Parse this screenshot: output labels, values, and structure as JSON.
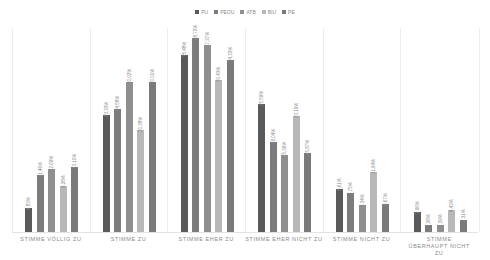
{
  "chart_data": {
    "type": "bar",
    "title": "",
    "xlabel": "",
    "ylabel": "",
    "ylim": [
      0,
      40
    ],
    "grid": false,
    "legend_position": "top",
    "categories": [
      "STIMME VÖLLIG ZU",
      "STIMME ZU",
      "STIMME EHER ZU",
      "STIMME EHER NICHT ZU",
      "STIMME NICHT ZU",
      "STIMME ÜBERHAUPT NICHT ZU"
    ],
    "series": [
      {
        "name": "PU",
        "color": "#5a5a5a",
        "values": [
          4.83,
          23.33,
          35.48,
          25.59,
          8.61,
          3.96
        ],
        "labels": [
          "4,83%",
          "23,33%",
          "35,48%",
          "25,59%",
          "8,61%",
          "3,96%"
        ]
      },
      {
        "name": "PEOU",
        "color": "#7c7c7c",
        "values": [
          11.46,
          24.58,
          38.72,
          18.04,
          7.75,
          1.38
        ],
        "labels": [
          "11,46%",
          "24,58%",
          "38,72%",
          "18,04%",
          "7,75%",
          "1,38%"
        ]
      },
      {
        "name": "ATB",
        "color": "#8f8f8f",
        "values": [
          12.69,
          30.02,
          37.37,
          15.36,
          5.34,
          1.39
        ],
        "labels": [
          "12,69%",
          "30,02%",
          "37,37%",
          "15,36%",
          "5,34%",
          "1,39%"
        ]
      },
      {
        "name": "BIU",
        "color": "#b8b8b8",
        "values": [
          9.28,
          20.38,
          30.43,
          23.19,
          11.94,
          4.43
        ],
        "labels": [
          "9,28%",
          "20,38%",
          "30,43%",
          "23,19%",
          "11,94%",
          "4,43%"
        ]
      },
      {
        "name": "PE",
        "color": "#7a7a7a",
        "values": [
          13.1,
          30.01,
          34.33,
          15.87,
          5.67,
          2.31
        ],
        "labels": [
          "13,10%",
          "30,01%",
          "34,33%",
          "15,87%",
          "5,67%",
          "2,31%"
        ]
      }
    ]
  }
}
